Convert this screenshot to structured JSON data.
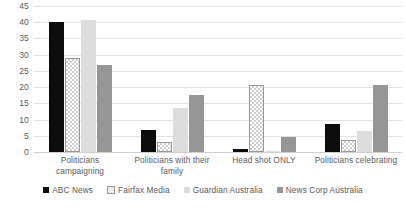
{
  "chart_data": {
    "type": "bar",
    "title": "",
    "subtitle": "",
    "xlabel": "",
    "ylabel": "",
    "ylim": [
      0,
      45
    ],
    "ytick_step": 5,
    "yticks": [
      "45",
      "40",
      "35",
      "30",
      "25",
      "20",
      "15",
      "10",
      "5",
      "0"
    ],
    "grid": true,
    "legend_position": "bottom",
    "categories": [
      "Politicians campaigning",
      "Politicians with their family",
      "Head shot ONLY",
      "Politicians celebrating"
    ],
    "series": [
      {
        "name": "ABC News",
        "color": "#0c0c0c",
        "fill": "solid-black",
        "values": [
          40.0,
          6.8,
          0.8,
          8.5
        ]
      },
      {
        "name": "Fairfax Media",
        "color": "#cfcfcf",
        "fill": "checkerboard",
        "values": [
          29.0,
          3.0,
          20.8,
          3.7
        ]
      },
      {
        "name": "Guardian Australia",
        "color": "#dddddd",
        "fill": "solid-light-gray",
        "values": [
          40.6,
          13.5,
          0.4,
          6.5
        ]
      },
      {
        "name": "News Corp Australia",
        "color": "#969696",
        "fill": "solid-medium-gray",
        "values": [
          26.8,
          17.7,
          4.7,
          20.6
        ]
      }
    ]
  }
}
